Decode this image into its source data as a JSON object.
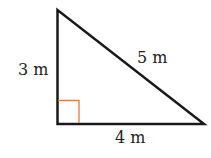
{
  "diagram": {
    "type": "right-triangle",
    "labels": {
      "vertical_side": "3 m",
      "hypotenuse": "5 m",
      "horizontal_side": "4 m"
    },
    "colors": {
      "edges": "#1a1a1a",
      "right_angle_marker": "#e8773a",
      "text": "#222222",
      "background": "#ffffff"
    }
  }
}
